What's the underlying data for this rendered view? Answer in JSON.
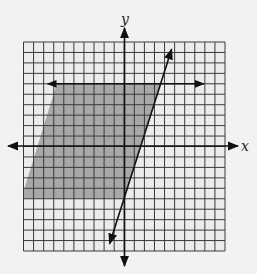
{
  "chart_data": {
    "type": "line",
    "title": "",
    "xlabel": "x",
    "ylabel": "y",
    "xlim": [
      -10,
      10
    ],
    "ylim": [
      -10,
      10
    ],
    "grid": true,
    "grid_step": 1,
    "tick_labels": [],
    "series": [
      {
        "name": "horizontal boundary line",
        "equation": "y = 6",
        "style": "solid with arrows",
        "x": [
          -7.6,
          7.9
        ],
        "y": [
          6,
          6
        ]
      },
      {
        "name": "slanted boundary line",
        "equation": "y = 3x - 5",
        "style": "solid with arrows",
        "x": [
          -1.45,
          4.7
        ],
        "y": [
          -9.3,
          9.3
        ]
      }
    ],
    "shaded_region": {
      "description": "Gray region bounded above by y = 6, on the right by y = 3x - 5, below at y = -5, extending left beyond the grid",
      "vertices": [
        [
          -6.7,
          6
        ],
        [
          3.67,
          6
        ],
        [
          0,
          -5
        ],
        [
          -10,
          -5
        ],
        [
          -10,
          -4.3
        ]
      ],
      "color": "#a8a8a8"
    }
  },
  "colors": {
    "background": "#f2f2f2",
    "grid_fill": "#ececec",
    "grid_line": "#3a3a3a",
    "shade": "#a8a8a8",
    "line": "#111111"
  }
}
